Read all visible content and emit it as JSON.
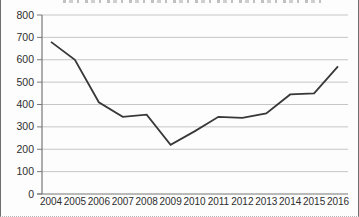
{
  "figure": {
    "background": "#fdfdfd",
    "border_color": "#6e6e6e"
  },
  "chart_data": {
    "type": "line",
    "title": "",
    "categories": [
      "2004",
      "2005",
      "2006",
      "2007",
      "2008",
      "2009",
      "2010",
      "2011",
      "2012",
      "2013",
      "2014",
      "2015",
      "2016"
    ],
    "values": [
      680,
      600,
      410,
      345,
      355,
      220,
      280,
      345,
      340,
      360,
      445,
      450,
      570
    ],
    "xlabel": "",
    "ylabel": "",
    "ylim": [
      0,
      800
    ],
    "ytick_step": 100,
    "yticks": [
      0,
      100,
      200,
      300,
      400,
      500,
      600,
      700,
      800
    ],
    "ytick_labels": [
      "0",
      "100",
      "200",
      "300",
      "400",
      "500",
      "600",
      "700",
      "800"
    ],
    "grid": "horizontal",
    "legend": false,
    "line_color": "#383838",
    "grid_color": "#c6c6c6",
    "axis_color": "#787878",
    "tick_label_color": "#2e2e2e"
  }
}
